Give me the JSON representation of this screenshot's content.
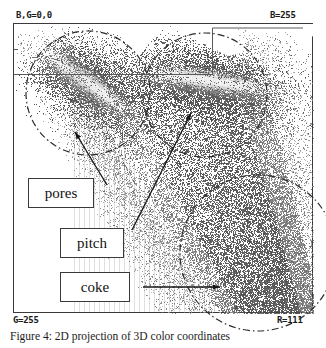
{
  "figure": {
    "caption": "Figure 4: 2D projection of 3D color coordinates",
    "frame": {
      "x": 13,
      "y": 23,
      "width": 300,
      "height": 290
    }
  },
  "axis_labels": {
    "top_left": "B,G=0,0",
    "top_right": "B=255",
    "bottom_left": "G=255",
    "bottom_right": "R=111",
    "gridline_vertical": "B=156",
    "gridline_horizontal": "G=43"
  },
  "callouts": [
    {
      "name": "pores",
      "label": "pores"
    },
    {
      "name": "pitch",
      "label": "pitch"
    },
    {
      "name": "coke",
      "label": "coke"
    }
  ],
  "colors": {
    "frame": "#3a3a3a",
    "text": "#1a1a1a",
    "background": "#ffffff",
    "cloud_dark": "#4a4a4a",
    "cloud_mid": "#7d7d7d",
    "cloud_light": "#c9c9c9",
    "cloud_bright": "#e8e8e8",
    "annotation": "#2b2b2b"
  },
  "chart_data": {
    "type": "scatter",
    "title": "2D projection of 3D color coordinates",
    "xlabel": "B",
    "ylabel": "G",
    "grid": false,
    "legend_position": "none",
    "axis_corners": {
      "top_left": {
        "B": 0,
        "G": 0
      },
      "top_right": {
        "B": 255
      },
      "bottom_left": {
        "G": 255
      },
      "bottom_right": {
        "R": 111
      }
    },
    "gridlines": [
      {
        "orientation": "vertical",
        "label": "B=156",
        "value": 156,
        "pixel_x": 199
      },
      {
        "orientation": "horizontal",
        "label": "G=43",
        "value": 43,
        "pixel_y": 73
      }
    ],
    "clusters": [
      {
        "name": "pores",
        "label": "pores",
        "center_px": [
          75,
          70
        ],
        "radius_px": 62,
        "marker": "dash-dot-circle",
        "density": "high",
        "description": "bright elongated lobe at upper-left of the cloud"
      },
      {
        "name": "pitch",
        "label": "pitch",
        "center_px": [
          192,
          72
        ],
        "radius_px": 62,
        "marker": "dash-dot-circle",
        "density": "high",
        "description": "bright elongated lobe at upper-middle-right of the cloud"
      },
      {
        "name": "coke",
        "label": "coke",
        "center_px": [
          245,
          230
        ],
        "radius_px": 78,
        "marker": "dash-dot-circle",
        "density": "medium",
        "description": "broad dark region in the lower-right of the cloud"
      }
    ],
    "annotations": [
      {
        "text": "pores",
        "from_px": [
          94,
          185
        ],
        "to_px": [
          62,
          132
        ]
      },
      {
        "text": "pitch",
        "from_px": [
          119,
          230
        ],
        "to_px": [
          178,
          113
        ]
      },
      {
        "text": "coke",
        "from_px": [
          130,
          287
        ],
        "to_px": [
          207,
          287
        ]
      }
    ],
    "point_count_estimate": 38000,
    "intensity_levels": [
      "#e8e8e8",
      "#c9c9c9",
      "#9a9a9a",
      "#7d7d7d",
      "#5e5e5e",
      "#4a4a4a"
    ]
  }
}
